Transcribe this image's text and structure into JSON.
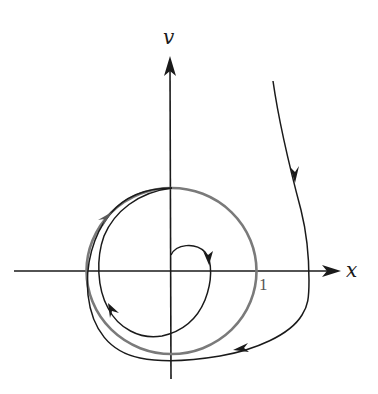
{
  "figure": {
    "axes": {
      "horizontal_label": "x",
      "vertical_label": "v",
      "tick_label_x": "1"
    },
    "elements": {
      "limit_cycle": {
        "label": "limit cycle",
        "radius_label": "1",
        "color": "#7a7a7a"
      },
      "outer_trajectory": {
        "label": "trajectory approaching from outside",
        "color": "#1a1a1a"
      },
      "inner_trajectory": {
        "label": "trajectory spiraling outward from near origin",
        "color": "#1a1a1a"
      },
      "axes_color": "#1a1a1a"
    }
  }
}
